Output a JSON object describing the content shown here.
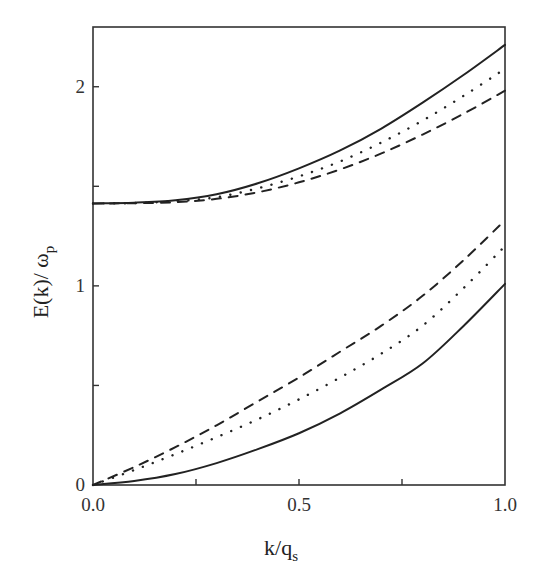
{
  "chart_data": {
    "type": "line",
    "title": "",
    "xlabel": "k/q",
    "xlabel_sub": "s",
    "ylabel": "E(k)/ ω",
    "ylabel_sub": "p",
    "xlim": [
      0.0,
      1.0
    ],
    "ylim": [
      0.0,
      2.3
    ],
    "grid": false,
    "legend": null,
    "x_ticks": [
      {
        "value": 0.0,
        "label": "0.0"
      },
      {
        "value": 0.25,
        "label": ""
      },
      {
        "value": 0.5,
        "label": "0.5"
      },
      {
        "value": 0.75,
        "label": ""
      },
      {
        "value": 1.0,
        "label": "1.0"
      }
    ],
    "y_ticks": [
      {
        "value": 0,
        "label": "0"
      },
      {
        "value": 0.5,
        "label": ""
      },
      {
        "value": 1,
        "label": "1"
      },
      {
        "value": 1.5,
        "label": ""
      },
      {
        "value": 2,
        "label": "2"
      }
    ],
    "x": [
      0.0,
      0.1,
      0.2,
      0.3,
      0.4,
      0.5,
      0.6,
      0.7,
      0.8,
      0.9,
      1.0
    ],
    "series": [
      {
        "name": "upper branch (solid)",
        "style": "solid",
        "values": [
          1.414,
          1.418,
          1.43,
          1.46,
          1.515,
          1.59,
          1.68,
          1.79,
          1.92,
          2.06,
          2.21
        ]
      },
      {
        "name": "upper branch (dotted)",
        "style": "dotted",
        "values": [
          1.414,
          1.416,
          1.425,
          1.445,
          1.49,
          1.55,
          1.625,
          1.72,
          1.83,
          1.955,
          2.09
        ]
      },
      {
        "name": "upper branch (dashed)",
        "style": "dashed",
        "values": [
          1.414,
          1.415,
          1.42,
          1.437,
          1.47,
          1.52,
          1.585,
          1.665,
          1.76,
          1.865,
          1.98
        ]
      },
      {
        "name": "lower branch (solid)",
        "style": "solid",
        "values": [
          0.0,
          0.02,
          0.055,
          0.11,
          0.18,
          0.26,
          0.36,
          0.48,
          0.61,
          0.8,
          1.01
        ]
      },
      {
        "name": "lower branch (dotted)",
        "style": "dotted",
        "values": [
          0.0,
          0.075,
          0.155,
          0.24,
          0.33,
          0.43,
          0.54,
          0.66,
          0.8,
          0.99,
          1.2
        ]
      },
      {
        "name": "lower branch (dashed)",
        "style": "dashed",
        "values": [
          0.0,
          0.09,
          0.19,
          0.3,
          0.42,
          0.54,
          0.67,
          0.8,
          0.95,
          1.13,
          1.33
        ]
      }
    ]
  },
  "colors": {
    "line": "#222222",
    "axis": "#333333",
    "background": "#ffffff"
  }
}
